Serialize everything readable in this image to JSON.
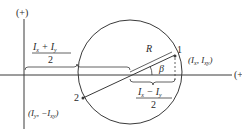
{
  "diagram": {
    "type": "mohr-circle",
    "axes": {
      "vertical_label": "(+)",
      "horizontal_label": "(+)"
    },
    "points": [
      {
        "id": "1",
        "label": "1",
        "coords_text_main": "(I",
        "coords_text": "(Ix, Ixy)"
      },
      {
        "id": "2",
        "label": "2",
        "coords_text": "(Iy, −Ixy)"
      }
    ],
    "labels": {
      "radius": "R",
      "angle": "β",
      "center_offset": "(Ix + Iy)/2",
      "half_difference": "(Ix − Iy)/2",
      "two": "2"
    },
    "colors": {
      "line": "#3a3a3a",
      "text": "#2a2a2a",
      "background": "#ffffff"
    }
  }
}
